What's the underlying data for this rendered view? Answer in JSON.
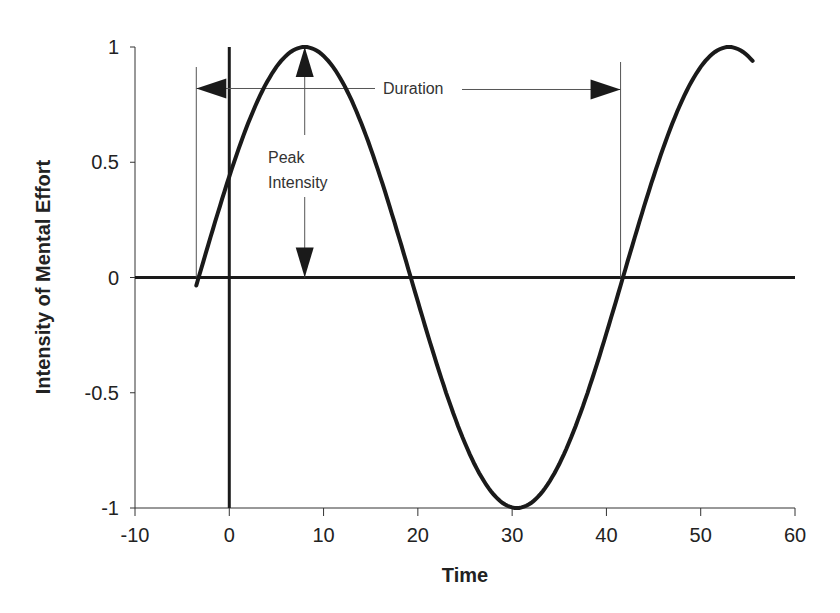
{
  "chart_data": {
    "type": "line",
    "title": "",
    "xlabel": "Time",
    "ylabel": "Intensity of Mental Effort",
    "xlim": [
      -10,
      60
    ],
    "ylim": [
      -1,
      1
    ],
    "x_ticks": [
      -10,
      0,
      10,
      20,
      30,
      40,
      50,
      60
    ],
    "x_tick_labels": [
      "-10",
      "0",
      "10",
      "20",
      "30",
      "40",
      "50",
      "60"
    ],
    "y_ticks": [
      1,
      0.5,
      0,
      -0.5,
      -1
    ],
    "y_tick_labels": [
      "1",
      "0.5",
      "0",
      "-0.5",
      "-1"
    ],
    "grid": false,
    "legend": null,
    "series": [
      {
        "name": "Mental effort wave",
        "description": "Sinusoid, period ~45 time units, amplitude 1",
        "x": [
          -3.5,
          0,
          4,
          8,
          12,
          16,
          19,
          22,
          26,
          30,
          34,
          38,
          41.5,
          45,
          49,
          53,
          55.5
        ],
        "y": [
          -0.05,
          0.45,
          0.85,
          1.0,
          0.87,
          0.42,
          0.0,
          -0.4,
          -0.86,
          -1.0,
          -0.86,
          -0.45,
          0.0,
          0.45,
          0.87,
          1.0,
          0.95
        ]
      }
    ],
    "reference_lines": [
      {
        "orientation": "horizontal",
        "y": 0,
        "style": "thick"
      },
      {
        "orientation": "vertical",
        "x": 0,
        "style": "thick"
      }
    ],
    "annotations": [
      {
        "text": "Duration",
        "type": "double-arrow",
        "from_x": -3.5,
        "to_x": 41.5,
        "y": 0.82
      },
      {
        "text": "Peak Intensity",
        "type": "double-arrow",
        "x": 8,
        "from_y": 0,
        "to_y": 1
      },
      {
        "text": "Peak",
        "line": 1
      },
      {
        "text": "Intensity",
        "line": 2
      }
    ]
  }
}
